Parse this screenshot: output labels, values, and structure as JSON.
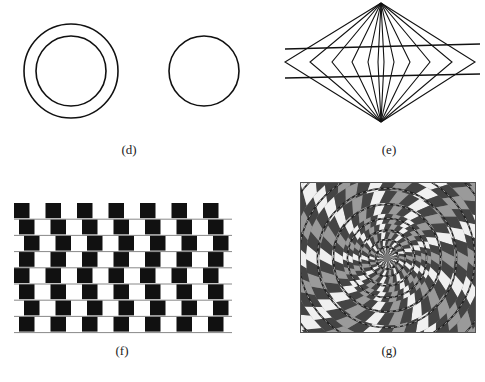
{
  "figure": {
    "panels": [
      {
        "id": "d",
        "label": "(d)",
        "name": "Delboeuf illusion",
        "elements": [
          "outer ring circle",
          "inner circle",
          "isolated circle"
        ]
      },
      {
        "id": "e",
        "label": "(e)",
        "name": "Hering illusion",
        "elements": [
          "radiating lines from two apexes",
          "two parallel horizontal lines"
        ]
      },
      {
        "id": "f",
        "label": "(f)",
        "name": "Cafe wall illusion",
        "rows": 8,
        "columns": 7
      },
      {
        "id": "g",
        "label": "(g)",
        "name": "Fraser spiral illusion",
        "colors": {
          "dark": "#4a4a4a",
          "mid": "#8a8a8a",
          "light": "#f2f2f2"
        }
      }
    ]
  },
  "captions": {
    "d": "(d)",
    "e": "(e)",
    "f": "(f)",
    "g": "(g)"
  },
  "colors": {
    "ink": "#111111",
    "mortar": "#888888",
    "background": "#ffffff"
  }
}
